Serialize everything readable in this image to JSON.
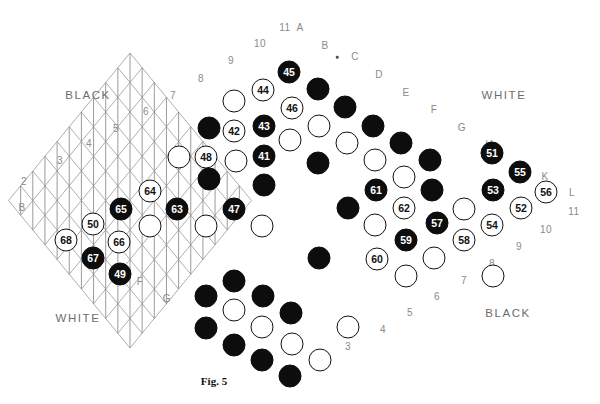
{
  "figure": {
    "caption": "Fig. 5",
    "caption_pos": [
      214,
      381
    ]
  },
  "board": {
    "type": "rhombic-triangular-lattice",
    "size": 11,
    "origin": [
      8.5,
      200.5
    ],
    "step_x": 24.3,
    "step_y": 14.75,
    "line_color": "#9a9a9a",
    "line_color_vertical": "#8f8f8f",
    "star_point": {
      "label_dot": true,
      "pos": [
        349,
        56
      ]
    }
  },
  "side_labels": [
    {
      "name": "black-top-left",
      "text": "BLACK",
      "pos": [
        88,
        95
      ]
    },
    {
      "name": "white-top-right",
      "text": "WHITE",
      "pos": [
        504,
        95
      ]
    },
    {
      "name": "white-bottom-left",
      "text": "WHITE",
      "pos": [
        78,
        318
      ]
    },
    {
      "name": "black-bottom-right",
      "text": "BLACK",
      "pos": [
        508,
        313
      ]
    }
  ],
  "edge_labels": {
    "top_left_numbers": [
      {
        "text": "2",
        "pos": [
          24,
          182
        ]
      },
      {
        "text": "3",
        "pos": [
          60,
          161
        ]
      },
      {
        "text": "4",
        "pos": [
          89,
          144
        ]
      },
      {
        "text": "5",
        "pos": [
          116,
          129
        ]
      },
      {
        "text": "6",
        "pos": [
          146,
          112
        ]
      },
      {
        "text": "7",
        "pos": [
          173,
          96
        ]
      },
      {
        "text": "8",
        "pos": [
          201,
          79
        ]
      },
      {
        "text": "9",
        "pos": [
          231,
          61
        ]
      },
      {
        "text": "10",
        "pos": [
          260,
          44
        ]
      },
      {
        "text": "11",
        "pos": [
          285,
          28
        ]
      }
    ],
    "top_right_letters": [
      {
        "text": "A",
        "pos": [
          300,
          28
        ]
      },
      {
        "text": "B",
        "pos": [
          325,
          46
        ]
      },
      {
        "text": "C",
        "pos": [
          355,
          57
        ]
      },
      {
        "text": "D",
        "pos": [
          379,
          75
        ]
      },
      {
        "text": "E",
        "pos": [
          406,
          93
        ]
      },
      {
        "text": "F",
        "pos": [
          434,
          110
        ]
      },
      {
        "text": "G",
        "pos": [
          462,
          128
        ]
      },
      {
        "text": "H",
        "pos": [
          489,
          145
        ]
      },
      {
        "text": "K",
        "pos": [
          545,
          177
        ]
      },
      {
        "text": "L",
        "pos": [
          572,
          193
        ]
      }
    ],
    "bottom_right_numbers": [
      {
        "text": "11",
        "pos": [
          574,
          212
        ]
      },
      {
        "text": "10",
        "pos": [
          546,
          230
        ]
      },
      {
        "text": "9",
        "pos": [
          519,
          247
        ]
      },
      {
        "text": "8",
        "pos": [
          492,
          264
        ]
      },
      {
        "text": "7",
        "pos": [
          464,
          281
        ]
      },
      {
        "text": "6",
        "pos": [
          437,
          297
        ]
      },
      {
        "text": "5",
        "pos": [
          410,
          313
        ]
      },
      {
        "text": "4",
        "pos": [
          383,
          330
        ]
      },
      {
        "text": "3",
        "pos": [
          348,
          347
        ]
      }
    ],
    "bottom_left_letters": [
      {
        "text": "B",
        "pos": [
          22,
          208
        ]
      },
      {
        "text": "F",
        "pos": [
          140,
          282
        ]
      },
      {
        "text": "G",
        "pos": [
          167,
          299
        ]
      }
    ]
  },
  "stones": [
    {
      "n": "45",
      "c": "b",
      "pos": [
        289,
        72
      ]
    },
    {
      "n": "44",
      "c": "w",
      "pos": [
        263,
        90
      ]
    },
    {
      "n": "46",
      "c": "w",
      "pos": [
        292,
        108
      ]
    },
    {
      "n": "43",
      "c": "b",
      "pos": [
        264,
        126
      ]
    },
    {
      "n": "42",
      "c": "w",
      "pos": [
        234,
        131
      ]
    },
    {
      "n": "48",
      "c": "w",
      "pos": [
        206,
        157
      ]
    },
    {
      "n": "41",
      "c": "b",
      "pos": [
        264,
        156
      ]
    },
    {
      "n": "51",
      "c": "b",
      "pos": [
        492,
        153
      ]
    },
    {
      "n": "55",
      "c": "b",
      "pos": [
        520,
        172
      ]
    },
    {
      "n": "56",
      "c": "w",
      "pos": [
        546,
        192
      ]
    },
    {
      "n": "64",
      "c": "w",
      "pos": [
        150,
        191
      ]
    },
    {
      "n": "65",
      "c": "b",
      "pos": [
        121,
        209
      ]
    },
    {
      "n": "63",
      "c": "b",
      "pos": [
        177,
        209
      ]
    },
    {
      "n": "47",
      "c": "b",
      "pos": [
        234,
        209
      ]
    },
    {
      "n": "61",
      "c": "b",
      "pos": [
        376,
        190
      ]
    },
    {
      "n": "53",
      "c": "b",
      "pos": [
        493,
        190
      ]
    },
    {
      "n": "62",
      "c": "w",
      "pos": [
        404,
        208
      ]
    },
    {
      "n": "52",
      "c": "w",
      "pos": [
        521,
        208
      ]
    },
    {
      "n": "50",
      "c": "w",
      "pos": [
        93,
        224
      ]
    },
    {
      "n": "57",
      "c": "b",
      "pos": [
        437,
        223
      ]
    },
    {
      "n": "54",
      "c": "w",
      "pos": [
        492,
        225
      ]
    },
    {
      "n": "68",
      "c": "w",
      "pos": [
        66,
        240
      ]
    },
    {
      "n": "66",
      "c": "w",
      "pos": [
        119,
        242
      ]
    },
    {
      "n": "59",
      "c": "b",
      "pos": [
        406,
        240
      ]
    },
    {
      "n": "58",
      "c": "w",
      "pos": [
        464,
        240
      ]
    },
    {
      "n": "67",
      "c": "b",
      "pos": [
        93,
        258
      ]
    },
    {
      "n": "60",
      "c": "w",
      "pos": [
        377,
        259
      ]
    },
    {
      "n": "49",
      "c": "b",
      "pos": [
        120,
        274
      ]
    },
    {
      "n": "",
      "c": "b",
      "pos": [
        318,
        89
      ]
    },
    {
      "n": "",
      "c": "w",
      "pos": [
        234,
        101
      ]
    },
    {
      "n": "",
      "c": "b",
      "pos": [
        209,
        128
      ]
    },
    {
      "n": "",
      "c": "b",
      "pos": [
        345,
        107
      ]
    },
    {
      "n": "",
      "c": "w",
      "pos": [
        319,
        126
      ]
    },
    {
      "n": "",
      "c": "b",
      "pos": [
        373,
        126
      ]
    },
    {
      "n": "",
      "c": "w",
      "pos": [
        290,
        140
      ]
    },
    {
      "n": "",
      "c": "w",
      "pos": [
        347,
        143
      ]
    },
    {
      "n": "",
      "c": "b",
      "pos": [
        401,
        143
      ]
    },
    {
      "n": "",
      "c": "w",
      "pos": [
        179,
        157
      ]
    },
    {
      "n": "",
      "c": "w",
      "pos": [
        236,
        161
      ]
    },
    {
      "n": "",
      "c": "w",
      "pos": [
        375,
        160
      ]
    },
    {
      "n": "",
      "c": "b",
      "pos": [
        318,
        163
      ]
    },
    {
      "n": "",
      "c": "b",
      "pos": [
        430,
        160
      ]
    },
    {
      "n": "",
      "c": "b",
      "pos": [
        209,
        179
      ]
    },
    {
      "n": "",
      "c": "w",
      "pos": [
        404,
        177
      ]
    },
    {
      "n": "",
      "c": "b",
      "pos": [
        264,
        185
      ]
    },
    {
      "n": "",
      "c": "b",
      "pos": [
        432,
        190
      ]
    },
    {
      "n": "",
      "c": "b",
      "pos": [
        348,
        208
      ]
    },
    {
      "n": "",
      "c": "w",
      "pos": [
        150,
        226
      ]
    },
    {
      "n": "",
      "c": "w",
      "pos": [
        206,
        226
      ]
    },
    {
      "n": "",
      "c": "w",
      "pos": [
        262,
        226
      ]
    },
    {
      "n": "",
      "c": "w",
      "pos": [
        375,
        225
      ]
    },
    {
      "n": "",
      "c": "w",
      "pos": [
        464,
        209
      ]
    },
    {
      "n": "",
      "c": "b",
      "pos": [
        319,
        258
      ]
    },
    {
      "n": "",
      "c": "w",
      "pos": [
        434,
        258
      ]
    },
    {
      "n": "",
      "c": "b",
      "pos": [
        234,
        281
      ]
    },
    {
      "n": "",
      "c": "w",
      "pos": [
        406,
        276
      ]
    },
    {
      "n": "",
      "c": "b",
      "pos": [
        206,
        296
      ]
    },
    {
      "n": "",
      "c": "b",
      "pos": [
        263,
        296
      ]
    },
    {
      "n": "",
      "c": "w",
      "pos": [
        234,
        310
      ]
    },
    {
      "n": "",
      "c": "b",
      "pos": [
        291,
        313
      ]
    },
    {
      "n": "",
      "c": "b",
      "pos": [
        206,
        328
      ]
    },
    {
      "n": "",
      "c": "w",
      "pos": [
        262,
        327
      ]
    },
    {
      "n": "",
      "c": "w",
      "pos": [
        348,
        327
      ]
    },
    {
      "n": "",
      "c": "w",
      "pos": [
        493,
        276
      ]
    },
    {
      "n": "",
      "c": "b",
      "pos": [
        234,
        345
      ]
    },
    {
      "n": "",
      "c": "w",
      "pos": [
        292,
        344
      ]
    },
    {
      "n": "",
      "c": "b",
      "pos": [
        262,
        360
      ]
    },
    {
      "n": "",
      "c": "w",
      "pos": [
        320,
        360
      ]
    },
    {
      "n": "",
      "c": "b",
      "pos": [
        290,
        376
      ]
    }
  ]
}
